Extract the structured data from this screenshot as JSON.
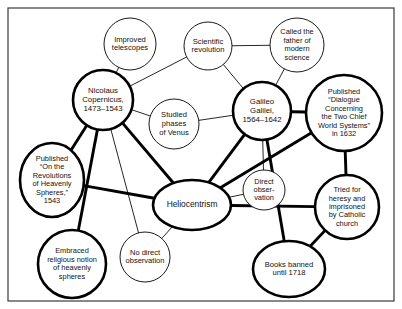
{
  "diagram": {
    "frame": {
      "x": 8,
      "y": 8,
      "width": 386,
      "height": 293,
      "color": "#3a3a3a"
    },
    "colors": {
      "stroke": "#000000",
      "fill": "#ffffff",
      "text": "#111111",
      "frame": "#3a3a3a"
    },
    "nodes": [
      {
        "id": "improved-telescopes",
        "label": "Improved telescopes",
        "lines": [
          "Improved",
          "telescopes"
        ],
        "shape": "circle",
        "emphasis": "weak",
        "cx": 130,
        "cy": 44,
        "rx": 26,
        "ry": 26,
        "font_size": 7.6,
        "line_height": 8.8
      },
      {
        "id": "scientific-revolution",
        "label": "Scientific revolution",
        "lines": [
          "Scientific",
          "revolution"
        ],
        "shape": "circle",
        "emphasis": "weak",
        "cx": 208,
        "cy": 46,
        "rx": 24,
        "ry": 24,
        "font_size": 7.6,
        "line_height": 8.8
      },
      {
        "id": "father-of-modern-science",
        "label": "Called the father of modern science",
        "lines": [
          "Called the",
          "father of",
          "modern",
          "science"
        ],
        "shape": "circle",
        "emphasis": "weak",
        "cx": 297,
        "cy": 45,
        "rx": 27,
        "ry": 27,
        "font_size": 7.4,
        "line_height": 8.4
      },
      {
        "id": "nicolaus-copernicus",
        "label": "Nicolaus Copernicus, 1473–1543",
        "lines": [
          "Nicolaus",
          "Copernicus,",
          "1473–1543"
        ],
        "shape": "circle",
        "emphasis": "strong",
        "cx": 103,
        "cy": 100,
        "rx": 30,
        "ry": 30,
        "font_size": 7.8,
        "line_height": 9.0
      },
      {
        "id": "studied-phases-of-venus",
        "label": "Studied phases of Venus",
        "lines": [
          "Studied",
          "phases",
          "of Venus"
        ],
        "shape": "circle",
        "emphasis": "weak",
        "cx": 174,
        "cy": 124,
        "rx": 25,
        "ry": 25,
        "font_size": 7.6,
        "line_height": 8.8
      },
      {
        "id": "galileo-galilei",
        "label": "Galileo Galilei, 1564–1642",
        "lines": [
          "Galileo",
          "Galilei,",
          "1564–1642"
        ],
        "shape": "circle",
        "emphasis": "strong",
        "cx": 262,
        "cy": 111,
        "rx": 29,
        "ry": 29,
        "font_size": 7.8,
        "line_height": 9.0
      },
      {
        "id": "published-dialogue",
        "label": "Published “Dialogue Concerning the Two Chief World Systems” in 1632",
        "lines": [
          "Published",
          "“Dialogue",
          "Concerning",
          "the Two Chief",
          "World Systems”",
          "in 1632"
        ],
        "shape": "circle",
        "emphasis": "strong",
        "cx": 344,
        "cy": 113,
        "rx": 38,
        "ry": 38,
        "font_size": 7.4,
        "line_height": 8.4
      },
      {
        "id": "published-on-revolutions",
        "label": "Published “On the Revolutions of Heavenly Spheres,” 1543",
        "lines": [
          "Published",
          "“On the",
          "Revolutions",
          "of Heavenly",
          "Spheres,”",
          "1543"
        ],
        "shape": "ellipse",
        "emphasis": "strong",
        "cx": 52,
        "cy": 180,
        "rx": 32,
        "ry": 37,
        "font_size": 7.4,
        "line_height": 8.4
      },
      {
        "id": "heliocentrism",
        "label": "Heliocentrism",
        "lines": [
          "Heliocentrism"
        ],
        "shape": "ellipse",
        "emphasis": "strong",
        "cx": 192,
        "cy": 205,
        "rx": 39,
        "ry": 25,
        "font_size": 8.4,
        "line_height": 9.4
      },
      {
        "id": "direct-observation",
        "label": "Direct obser-vation",
        "lines": [
          "Direct",
          "obser-",
          "vation"
        ],
        "shape": "ellipse",
        "emphasis": "weak",
        "cx": 264,
        "cy": 190,
        "rx": 21,
        "ry": 20,
        "font_size": 7.4,
        "line_height": 8.4
      },
      {
        "id": "tried-for-heresy",
        "label": "Tried for heresy and imprisoned by Catholic church",
        "lines": [
          "Tried for",
          "heresy and",
          "imprisoned",
          "by Catholic",
          "church"
        ],
        "shape": "circle",
        "emphasis": "strong",
        "cx": 347,
        "cy": 207,
        "rx": 32,
        "ry": 32,
        "font_size": 7.4,
        "line_height": 8.4
      },
      {
        "id": "embraced-religious-notion",
        "label": "Embraced religious notion of heavenly spheres",
        "lines": [
          "Embraced",
          "religious notion",
          "of heavenly",
          "spheres"
        ],
        "shape": "circle",
        "emphasis": "strong",
        "cx": 72,
        "cy": 264,
        "rx": 34,
        "ry": 34,
        "font_size": 7.4,
        "line_height": 8.4
      },
      {
        "id": "no-direct-observation",
        "label": "No direct observation",
        "lines": [
          "No direct",
          "observation"
        ],
        "shape": "circle",
        "emphasis": "weak",
        "cx": 145,
        "cy": 257,
        "rx": 25,
        "ry": 25,
        "font_size": 7.5,
        "line_height": 8.6
      },
      {
        "id": "books-banned",
        "label": "Books banned until 1718",
        "lines": [
          "Books banned",
          "until 1718"
        ],
        "shape": "ellipse",
        "emphasis": "strong",
        "cx": 289,
        "cy": 269,
        "rx": 36,
        "ry": 28,
        "font_size": 7.6,
        "line_height": 8.8
      }
    ],
    "edges": [
      {
        "id": "e1",
        "from": "nicolaus-copernicus",
        "to": "improved-telescopes",
        "emphasis": "weak"
      },
      {
        "id": "e2",
        "from": "nicolaus-copernicus",
        "to": "scientific-revolution",
        "emphasis": "weak"
      },
      {
        "id": "e3",
        "from": "scientific-revolution",
        "to": "father-of-modern-science",
        "emphasis": "weak"
      },
      {
        "id": "e4",
        "from": "scientific-revolution",
        "to": "galileo-galilei",
        "emphasis": "weak"
      },
      {
        "id": "e5",
        "from": "father-of-modern-science",
        "to": "galileo-galilei",
        "emphasis": "weak"
      },
      {
        "id": "e6",
        "from": "nicolaus-copernicus",
        "to": "studied-phases-of-venus",
        "emphasis": "weak"
      },
      {
        "id": "e7",
        "from": "studied-phases-of-venus",
        "to": "galileo-galilei",
        "emphasis": "weak"
      },
      {
        "id": "e8",
        "from": "galileo-galilei",
        "to": "published-dialogue",
        "emphasis": "strong"
      },
      {
        "id": "e9",
        "from": "nicolaus-copernicus",
        "to": "published-on-revolutions",
        "emphasis": "strong"
      },
      {
        "id": "e10",
        "from": "nicolaus-copernicus",
        "to": "heliocentrism",
        "emphasis": "strong"
      },
      {
        "id": "e11",
        "from": "nicolaus-copernicus",
        "to": "embraced-religious-notion",
        "emphasis": "strong"
      },
      {
        "id": "e12",
        "from": "nicolaus-copernicus",
        "to": "no-direct-observation",
        "emphasis": "weak"
      },
      {
        "id": "e13",
        "from": "published-on-revolutions",
        "to": "heliocentrism",
        "emphasis": "strong"
      },
      {
        "id": "e14",
        "from": "galileo-galilei",
        "to": "heliocentrism",
        "emphasis": "strong"
      },
      {
        "id": "e15",
        "from": "galileo-galilei",
        "to": "direct-observation",
        "emphasis": "weak"
      },
      {
        "id": "e16",
        "from": "heliocentrism",
        "to": "direct-observation",
        "emphasis": "weak"
      },
      {
        "id": "e17",
        "from": "heliocentrism",
        "to": "published-dialogue",
        "emphasis": "strong"
      },
      {
        "id": "e18",
        "from": "heliocentrism",
        "to": "tried-for-heresy",
        "emphasis": "strong"
      },
      {
        "id": "e19",
        "from": "published-dialogue",
        "to": "tried-for-heresy",
        "emphasis": "strong"
      },
      {
        "id": "e20",
        "from": "galileo-galilei",
        "to": "books-banned",
        "emphasis": "strong"
      },
      {
        "id": "e21",
        "from": "books-banned",
        "to": "tried-for-heresy",
        "emphasis": "strong"
      },
      {
        "id": "e22",
        "from": "heliocentrism",
        "to": "no-direct-observation",
        "emphasis": "weak"
      }
    ]
  }
}
